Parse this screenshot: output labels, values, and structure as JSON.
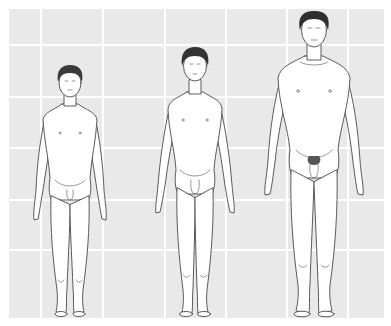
{
  "illustration": {
    "subject": "Three standing male figures showing progressive stages of adolescent physical development",
    "background": {
      "color": "#e9e9e9",
      "grid_line_color": "#ffffff",
      "plate": {
        "x": 9,
        "y": 9,
        "width": 375,
        "height": 309
      },
      "horizontal_lines_y": [
        45,
        97,
        148,
        200,
        250
      ],
      "vertical_lines_x": [
        41,
        103,
        165,
        226,
        287,
        348
      ]
    },
    "line_color": "#4a4a4a",
    "skin_fill": "#ffffff",
    "hair_color": "#3a3a3a",
    "figures": [
      {
        "label": "figure-early-stage",
        "center_x": 70,
        "head_top_y": 66,
        "shoulder_y": 113,
        "shoulder_half_width": 34,
        "hand_bottom_y": 220,
        "feet_y": 316
      },
      {
        "label": "figure-middle-stage",
        "center_x": 195,
        "head_top_y": 48,
        "shoulder_y": 100,
        "shoulder_half_width": 31,
        "hand_bottom_y": 213,
        "feet_y": 316
      },
      {
        "label": "figure-late-stage",
        "center_x": 314,
        "head_top_y": 12,
        "shoulder_y": 68,
        "shoulder_half_width": 37,
        "hand_bottom_y": 195,
        "feet_y": 316
      }
    ]
  }
}
